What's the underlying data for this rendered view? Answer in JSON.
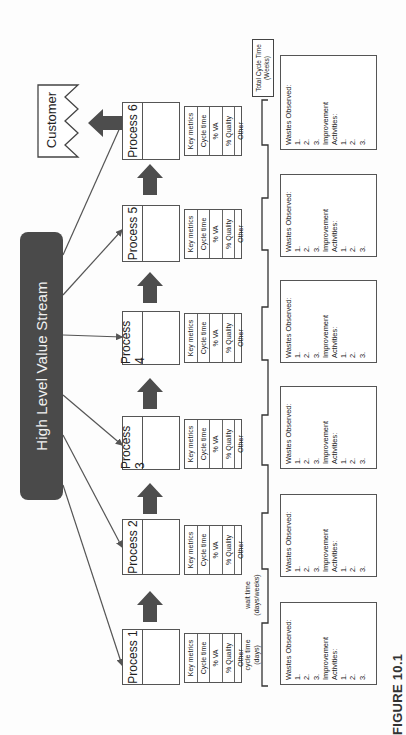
{
  "diagram": {
    "hub": {
      "label": "High Level Value Stream"
    },
    "customer": {
      "label": "Customer"
    },
    "processes": [
      {
        "label": "Process 1",
        "metrics": [
          "Key metrics",
          "Cycle time",
          "% VA",
          "% Quality",
          "Other"
        ]
      },
      {
        "label": "Process 2",
        "metrics": [
          "Key metrics",
          "Cycle time",
          "% VA",
          "% Quality",
          "Other"
        ]
      },
      {
        "label": "Process 3",
        "metrics": [
          "Key metrics",
          "Cycle time",
          "% VA",
          "% Quality",
          "Other"
        ]
      },
      {
        "label": "Process 4",
        "metrics": [
          "Key metrics",
          "Cycle time",
          "% VA",
          "% Quality",
          "Other"
        ]
      },
      {
        "label": "Process 5",
        "metrics": [
          "Key metrics",
          "Cycle time",
          "% VA",
          "% Quality",
          "Other"
        ]
      },
      {
        "label": "Process 6",
        "metrics": [
          "Key metrics",
          "Cycle time",
          "% VA",
          "% Quality",
          "Other"
        ]
      }
    ],
    "waste_boxes": [
      {
        "title": "Wastes Observed:",
        "items": [
          "1.",
          "2.",
          "3."
        ],
        "improvement_title_1": "Improvement",
        "improvement_title_2": "Activities:",
        "improvement_items": [
          "1.",
          "2.",
          "3."
        ]
      },
      {
        "title": "Wastes Observed:",
        "items": [
          "1.",
          "2.",
          "3."
        ],
        "improvement_title_1": "Improvement",
        "improvement_title_2": "Activities:",
        "improvement_items": [
          "1.",
          "2.",
          "3."
        ]
      },
      {
        "title": "Wastes Observed:",
        "items": [
          "1.",
          "2.",
          "3."
        ],
        "improvement_title_1": "Improvement",
        "improvement_title_2": "Activities:",
        "improvement_items": [
          "1.",
          "2.",
          "3."
        ]
      },
      {
        "title": "Wastes Observed:",
        "items": [
          "1.",
          "2.",
          "3."
        ],
        "improvement_title_1": "Improvement",
        "improvement_title_2": "Activities:",
        "improvement_items": [
          "1.",
          "2.",
          "3."
        ]
      },
      {
        "title": "Wastes Observed:",
        "items": [
          "1.",
          "2.",
          "3."
        ],
        "improvement_title_1": "Improvement",
        "improvement_title_2": "Activities:",
        "improvement_items": [
          "1.",
          "2.",
          "3."
        ]
      },
      {
        "title": "Wastes Observed:",
        "items": [
          "1.",
          "2.",
          "3."
        ],
        "improvement_title_1": "Improvement",
        "improvement_title_2": "Activities:",
        "improvement_items": [
          "1.",
          "2.",
          "3."
        ]
      }
    ],
    "timeline": {
      "cycle_time_label_1": "cycle time",
      "cycle_time_label_2": "(days)",
      "wait_time_label_1": "wait time",
      "wait_time_label_2": "(days/weeks)",
      "total_label_1": "Total Cycle Time",
      "total_label_2": "(Weeks)"
    },
    "colors": {
      "hub": "#4a4a4a",
      "arrow": "#4d4d4d",
      "line": "#555555"
    }
  },
  "caption": {
    "figure_label": "FIGURE 10.1"
  }
}
